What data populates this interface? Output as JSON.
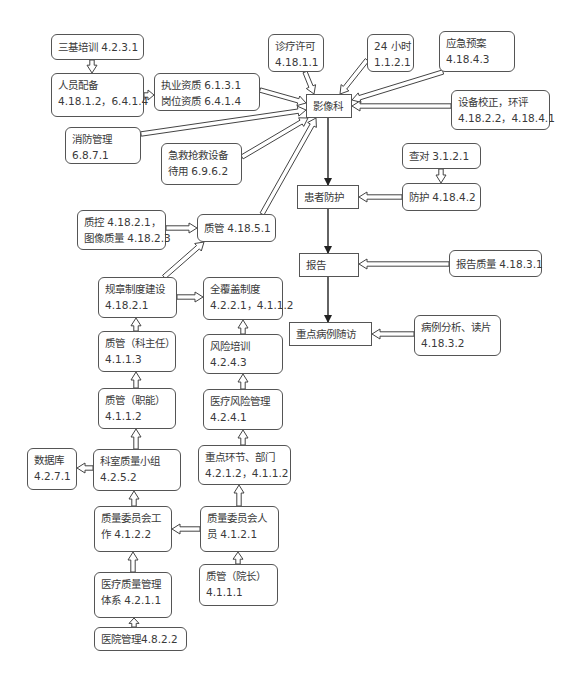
{
  "diagram": {
    "nodes": [
      {
        "id": "sanji",
        "line1": "三基培训 4.2.3.1",
        "line2": "",
        "shape": "round",
        "x": 51,
        "y": 34,
        "w": 93,
        "h": 26
      },
      {
        "id": "renyuan",
        "line1": "人员配备",
        "line2": "4.18.1.2，6.4.1.4",
        "shape": "round",
        "x": 51,
        "y": 73,
        "w": 93,
        "h": 44
      },
      {
        "id": "zhiye",
        "line1": "执业资质 6.1.3.1",
        "line2": "岗位资质 6.4.1.4",
        "shape": "round",
        "x": 154,
        "y": 73,
        "w": 106,
        "h": 38
      },
      {
        "id": "zhenliao",
        "line1": "诊疗许可",
        "line2": "4.18.1.1",
        "shape": "round",
        "x": 268,
        "y": 34,
        "w": 56,
        "h": 38
      },
      {
        "id": "24h",
        "line1": "24 小时",
        "line2": "1.1.2.1",
        "shape": "round",
        "x": 367,
        "y": 34,
        "w": 47,
        "h": 38
      },
      {
        "id": "yingji",
        "line1": "应急预案",
        "line2": "4.18.4.3",
        "shape": "round",
        "x": 439,
        "y": 31,
        "w": 76,
        "h": 41
      },
      {
        "id": "yingxiang",
        "line1": "影像科",
        "line2": "",
        "shape": "rect",
        "x": 306,
        "y": 94,
        "w": 46,
        "h": 24
      },
      {
        "id": "shebei",
        "line1": "设备校正，环评",
        "line2": "4.18.2.2，4.18.4.1",
        "shape": "round",
        "x": 451,
        "y": 90,
        "w": 99,
        "h": 40
      },
      {
        "id": "xiaofang",
        "line1": "消防管理",
        "line2": "6.8.7.1",
        "shape": "round",
        "x": 65,
        "y": 127,
        "w": 76,
        "h": 37
      },
      {
        "id": "jijiu",
        "line1": "急救抢救设备",
        "line2": "待用 6.9.6.2",
        "shape": "round",
        "x": 161,
        "y": 143,
        "w": 81,
        "h": 42
      },
      {
        "id": "chadui",
        "line1": "查对 3.1.2.1",
        "line2": "",
        "shape": "round",
        "x": 402,
        "y": 143,
        "w": 79,
        "h": 26
      },
      {
        "id": "huanzhe",
        "line1": "患者防护",
        "line2": "",
        "shape": "rect",
        "x": 297,
        "y": 185,
        "w": 62,
        "h": 24
      },
      {
        "id": "fanghu",
        "line1": "防护 4.18.4.2",
        "line2": "",
        "shape": "round",
        "x": 402,
        "y": 183,
        "w": 79,
        "h": 28
      },
      {
        "id": "zhikong",
        "line1": "质控 4.18.2.1，",
        "line2": "图像质量 4.18.2.3",
        "shape": "round",
        "x": 77,
        "y": 210,
        "w": 89,
        "h": 40
      },
      {
        "id": "zhiguan4185",
        "line1": "质管 4.18.5.1",
        "line2": "",
        "shape": "round",
        "x": 197,
        "y": 214,
        "w": 79,
        "h": 28
      },
      {
        "id": "baogao",
        "line1": "报告",
        "line2": "",
        "shape": "rect",
        "x": 299,
        "y": 253,
        "w": 60,
        "h": 24
      },
      {
        "id": "baogaozl",
        "line1": "报告质量 4.18.3.1",
        "line2": "",
        "shape": "round",
        "x": 449,
        "y": 250,
        "w": 93,
        "h": 27
      },
      {
        "id": "guizhang",
        "line1": "规章制度建设",
        "line2": "4.18.2.1",
        "shape": "round",
        "x": 98,
        "y": 277,
        "w": 79,
        "h": 41
      },
      {
        "id": "quanfugai",
        "line1": "全覆盖制度",
        "line2": "4.2.2.1，4.1.1.2",
        "shape": "round",
        "x": 203,
        "y": 277,
        "w": 80,
        "h": 43
      },
      {
        "id": "zhongdian",
        "line1": "重点病例随访",
        "line2": "",
        "shape": "rect",
        "x": 289,
        "y": 322,
        "w": 83,
        "h": 24
      },
      {
        "id": "bingli",
        "line1": "病例分析、读片",
        "line2": "4.18.3.2",
        "shape": "round",
        "x": 414,
        "y": 315,
        "w": 87,
        "h": 41
      },
      {
        "id": "zhiguankzr",
        "line1": "质管（科主任）",
        "line2": "4.1.1.3",
        "shape": "round",
        "x": 98,
        "y": 331,
        "w": 78,
        "h": 41
      },
      {
        "id": "fengxian",
        "line1": "风险培训",
        "line2": "4.2.4.3",
        "shape": "round",
        "x": 203,
        "y": 334,
        "w": 80,
        "h": 40
      },
      {
        "id": "zhiguanzn",
        "line1": "质管（职能）",
        "line2": "4.1.1.2",
        "shape": "round",
        "x": 98,
        "y": 388,
        "w": 78,
        "h": 41
      },
      {
        "id": "yiliaofx",
        "line1": "医疗风险管理",
        "line2": "4.2.4.1",
        "shape": "round",
        "x": 203,
        "y": 389,
        "w": 80,
        "h": 41
      },
      {
        "id": "shujuku",
        "line1": "数据库",
        "line2": "4.2.7.1",
        "shape": "round",
        "x": 27,
        "y": 448,
        "w": 50,
        "h": 42
      },
      {
        "id": "keshi",
        "line1": "科室质量小组",
        "line2": "4.2.5.2",
        "shape": "round",
        "x": 93,
        "y": 449,
        "w": 88,
        "h": 42
      },
      {
        "id": "zhongdianhj",
        "line1": "重点环节、部门",
        "line2": "4.2.1.2，4.1.1.2",
        "shape": "round",
        "x": 198,
        "y": 445,
        "w": 93,
        "h": 40
      },
      {
        "id": "weiyuangz",
        "line1": "质量委员会工",
        "line2": "作 4.1.2.2",
        "shape": "round",
        "x": 94,
        "y": 506,
        "w": 78,
        "h": 46
      },
      {
        "id": "weiyuanry",
        "line1": "质量委员会人",
        "line2": "员 4.1.2.1",
        "shape": "round",
        "x": 200,
        "y": 506,
        "w": 79,
        "h": 46
      },
      {
        "id": "yiliaozl",
        "line1": "医疗质量管理",
        "line2": "体系 4.2.1.1",
        "shape": "round",
        "x": 94,
        "y": 572,
        "w": 78,
        "h": 46
      },
      {
        "id": "zhiguanyz",
        "line1": "质管（院长）",
        "line2": "4.1.1.1",
        "shape": "round",
        "x": 199,
        "y": 564,
        "w": 79,
        "h": 42
      },
      {
        "id": "yiyuan",
        "line1": "医院管理4.8.2.2",
        "line2": "",
        "shape": "round",
        "x": 94,
        "y": 627,
        "w": 93,
        "h": 24
      }
    ],
    "edges": [
      {
        "from": "sanji",
        "to": "renyuan",
        "style": "hollow",
        "x1": 92,
        "y1": 60,
        "x2": 92,
        "y2": 73
      },
      {
        "from": "renyuan",
        "to": "zhiye",
        "style": "hollow",
        "x1": 144,
        "y1": 95,
        "x2": 154,
        "y2": 95
      },
      {
        "from": "zhiye",
        "to": "yingxiang",
        "style": "hollow",
        "x1": 260,
        "y1": 90,
        "x2": 306,
        "y2": 103
      },
      {
        "from": "zhenliao",
        "to": "yingxiang",
        "style": "hollow",
        "x1": 305,
        "y1": 72,
        "x2": 314,
        "y2": 94
      },
      {
        "from": "24h",
        "to": "yingxiang",
        "style": "hollow",
        "x1": 367,
        "y1": 60,
        "x2": 340,
        "y2": 94
      },
      {
        "from": "yingji",
        "to": "yingxiang",
        "style": "hollow",
        "x1": 443,
        "y1": 72,
        "x2": 352,
        "y2": 100
      },
      {
        "from": "shebei",
        "to": "yingxiang",
        "style": "hollow",
        "x1": 451,
        "y1": 106,
        "x2": 352,
        "y2": 106
      },
      {
        "from": "xiaofang",
        "to": "yingxiang",
        "style": "hollow",
        "x1": 141,
        "y1": 134,
        "x2": 306,
        "y2": 110
      },
      {
        "from": "jijiu",
        "to": "yingxiang",
        "style": "hollow",
        "x1": 242,
        "y1": 157,
        "x2": 308,
        "y2": 118
      },
      {
        "from": "zhiguan4185",
        "to": "yingxiang",
        "style": "hollow",
        "x1": 262,
        "y1": 214,
        "x2": 316,
        "y2": 118
      },
      {
        "from": "yingxiang",
        "to": "huanzhe",
        "style": "solid",
        "x1": 328,
        "y1": 118,
        "x2": 328,
        "y2": 185
      },
      {
        "from": "chadui",
        "to": "fanghu",
        "style": "hollow",
        "x1": 441,
        "y1": 169,
        "x2": 441,
        "y2": 183
      },
      {
        "from": "fanghu",
        "to": "huanzhe",
        "style": "hollow",
        "x1": 402,
        "y1": 197,
        "x2": 359,
        "y2": 197
      },
      {
        "from": "huanzhe",
        "to": "baogao",
        "style": "solid",
        "x1": 328,
        "y1": 209,
        "x2": 328,
        "y2": 253
      },
      {
        "from": "baogaozl",
        "to": "baogao",
        "style": "hollow",
        "x1": 449,
        "y1": 264,
        "x2": 359,
        "y2": 264
      },
      {
        "from": "baogao",
        "to": "zhongdian",
        "style": "solid",
        "x1": 328,
        "y1": 277,
        "x2": 328,
        "y2": 322
      },
      {
        "from": "bingli",
        "to": "zhongdian",
        "style": "hollow",
        "x1": 414,
        "y1": 334,
        "x2": 372,
        "y2": 334
      },
      {
        "from": "zhikong",
        "to": "zhiguan4185",
        "style": "hollow",
        "x1": 166,
        "y1": 228,
        "x2": 197,
        "y2": 228
      },
      {
        "from": "guizhang",
        "to": "zhiguan4185",
        "style": "hollow",
        "x1": 164,
        "y1": 277,
        "x2": 204,
        "y2": 242
      },
      {
        "from": "guizhang",
        "to": "quanfugai",
        "style": "hollow",
        "x1": 177,
        "y1": 297,
        "x2": 203,
        "y2": 297
      },
      {
        "from": "zhiguankzr",
        "to": "guizhang",
        "style": "hollow",
        "x1": 136,
        "y1": 331,
        "x2": 136,
        "y2": 318
      },
      {
        "from": "fengxian",
        "to": "quanfugai",
        "style": "hollow",
        "x1": 243,
        "y1": 334,
        "x2": 243,
        "y2": 320
      },
      {
        "from": "zhiguanzn",
        "to": "zhiguankzr",
        "style": "hollow",
        "x1": 136,
        "y1": 388,
        "x2": 136,
        "y2": 372
      },
      {
        "from": "yiliaofx",
        "to": "fengxian",
        "style": "hollow",
        "x1": 243,
        "y1": 389,
        "x2": 243,
        "y2": 374
      },
      {
        "from": "keshi",
        "to": "zhiguanzn",
        "style": "hollow",
        "x1": 136,
        "y1": 449,
        "x2": 136,
        "y2": 429
      },
      {
        "from": "zhongdianhj",
        "to": "yiliaofx",
        "style": "hollow",
        "x1": 243,
        "y1": 445,
        "x2": 243,
        "y2": 430
      },
      {
        "from": "keshi",
        "to": "shujuku",
        "style": "hollow",
        "x1": 93,
        "y1": 468,
        "x2": 77,
        "y2": 468
      },
      {
        "from": "weiyuangz",
        "to": "keshi",
        "style": "hollow",
        "x1": 134,
        "y1": 506,
        "x2": 134,
        "y2": 491
      },
      {
        "from": "weiyuanry",
        "to": "zhongdianhj",
        "style": "hollow",
        "x1": 239,
        "y1": 506,
        "x2": 239,
        "y2": 485
      },
      {
        "from": "weiyuanry",
        "to": "weiyuangz",
        "style": "hollow",
        "x1": 200,
        "y1": 529,
        "x2": 172,
        "y2": 529
      },
      {
        "from": "yiliaozl",
        "to": "weiyuangz",
        "style": "hollow",
        "x1": 133,
        "y1": 572,
        "x2": 133,
        "y2": 552
      },
      {
        "from": "zhiguanyz",
        "to": "weiyuanry",
        "style": "hollow",
        "x1": 238,
        "y1": 564,
        "x2": 238,
        "y2": 552
      },
      {
        "from": "yiyuan",
        "to": "yiliaozl",
        "style": "hollow",
        "x1": 134,
        "y1": 627,
        "x2": 134,
        "y2": 618
      }
    ]
  },
  "colors": {
    "border": "#555555",
    "text": "#3a3a3a",
    "arrow": "#444444",
    "background": "#ffffff"
  }
}
